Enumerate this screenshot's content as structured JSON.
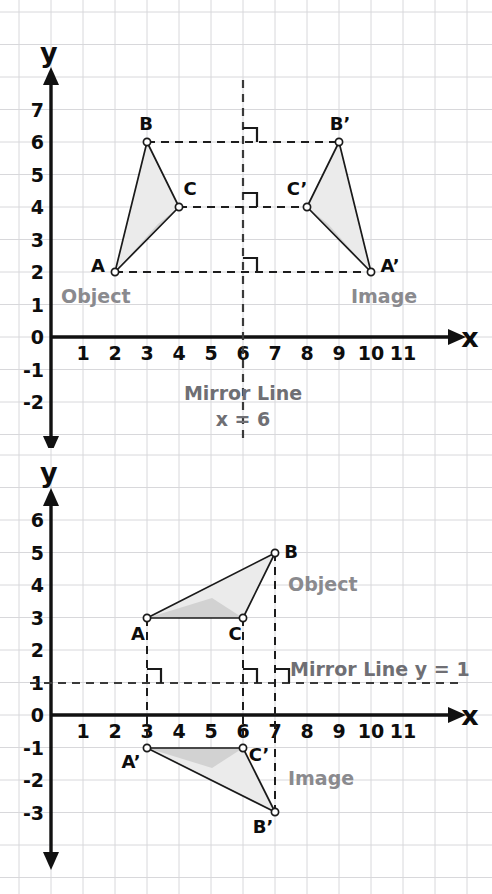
{
  "figure": {
    "title_hidden": "",
    "colors": {
      "grid": "#d8d8db",
      "axis": "#111111",
      "triangle_stroke": "#1a1a1a",
      "triangle_fill_light": "#ebebeb",
      "triangle_fill_mid": "#d2d2d2",
      "dashed": "#3a3a3a",
      "soft_text": "#8a8a8e",
      "mirror_text": "#6f6f74"
    }
  },
  "panels": [
    {
      "id": "reflection-in-vertical-mirror",
      "axis_x_label": "x",
      "axis_y_label": "y",
      "x_ticks": [
        "1",
        "2",
        "3",
        "4",
        "5",
        "6",
        "7",
        "8",
        "9",
        "10",
        "11"
      ],
      "y_ticks": [
        "7",
        "6",
        "5",
        "4",
        "3",
        "2",
        "1",
        "0",
        "-1",
        "-2"
      ],
      "object_label": "Object",
      "image_label": "Image",
      "mirror_label_line1": "Mirror Line",
      "mirror_label_line2": "x = 6",
      "vertex_labels": {
        "A": "A",
        "B": "B",
        "C": "C",
        "Ap": "A’",
        "Bp": "B’",
        "Cp": "C’"
      }
    },
    {
      "id": "reflection-in-horizontal-mirror",
      "axis_x_label": "x",
      "axis_y_label": "y",
      "x_ticks": [
        "1",
        "2",
        "3",
        "4",
        "5",
        "6",
        "7",
        "8",
        "9",
        "10",
        "11"
      ],
      "y_ticks": [
        "6",
        "5",
        "4",
        "3",
        "2",
        "1",
        "0",
        "-1",
        "-2",
        "-3"
      ],
      "object_label": "Object",
      "image_label": "Image",
      "mirror_label": "Mirror Line y = 1",
      "vertex_labels": {
        "A": "A",
        "B": "B",
        "C": "C",
        "Ap": "A’",
        "Bp": "B’",
        "Cp": "C’"
      }
    }
  ],
  "chart_data": [
    {
      "type": "scatter",
      "title": "Reflection of triangle ABC in the mirror line x = 6",
      "xlabel": "x",
      "ylabel": "y",
      "xlim": [
        0,
        12.8
      ],
      "ylim": [
        -2.6,
        7.6
      ],
      "grid": true,
      "legend": "none",
      "mirror_line": {
        "kind": "vertical",
        "equation": "x = 6",
        "x": 6
      },
      "series": [
        {
          "name": "Object",
          "points": [
            {
              "label": "A",
              "x": 2,
              "y": 2
            },
            {
              "label": "B",
              "x": 3,
              "y": 6
            },
            {
              "label": "C",
              "x": 4,
              "y": 4
            }
          ]
        },
        {
          "name": "Image",
          "points": [
            {
              "label": "A’",
              "x": 10,
              "y": 2
            },
            {
              "label": "B’",
              "x": 9,
              "y": 6
            },
            {
              "label": "C’",
              "x": 8,
              "y": 4
            }
          ]
        }
      ],
      "annotations": [
        {
          "text": "Object",
          "x": 2.1,
          "y": 1.1
        },
        {
          "text": "Image",
          "x": 9.1,
          "y": 1.1
        },
        {
          "text": "Mirror Line",
          "x": 6,
          "y": -1.85
        },
        {
          "text": "x = 6",
          "x": 6,
          "y": -2.4
        }
      ],
      "connector_lines": [
        {
          "from": [
            2,
            2
          ],
          "to": [
            10,
            2
          ]
        },
        {
          "from": [
            3,
            6
          ],
          "to": [
            9,
            6
          ]
        },
        {
          "from": [
            4,
            4
          ],
          "to": [
            8,
            4
          ]
        }
      ],
      "right_angle_marks": [
        {
          "x": 6,
          "y": 2
        },
        {
          "x": 6,
          "y": 4
        },
        {
          "x": 6,
          "y": 6
        }
      ]
    },
    {
      "type": "scatter",
      "title": "Reflection of triangle ABC in the mirror line y = 1",
      "xlabel": "x",
      "ylabel": "y",
      "xlim": [
        0,
        12.8
      ],
      "ylim": [
        -3.6,
        6.6
      ],
      "grid": true,
      "legend": "none",
      "mirror_line": {
        "kind": "horizontal",
        "equation": "y = 1",
        "y": 1
      },
      "series": [
        {
          "name": "Object",
          "points": [
            {
              "label": "A",
              "x": 3,
              "y": 3
            },
            {
              "label": "B",
              "x": 7,
              "y": 5
            },
            {
              "label": "C",
              "x": 6,
              "y": 3
            }
          ]
        },
        {
          "name": "Image",
          "points": [
            {
              "label": "A’",
              "x": 3,
              "y": -1
            },
            {
              "label": "B’",
              "x": 7,
              "y": -3
            },
            {
              "label": "C’",
              "x": 6,
              "y": -1
            }
          ]
        }
      ],
      "annotations": [
        {
          "text": "Object",
          "x": 7.4,
          "y": 4.1
        },
        {
          "text": "Image",
          "x": 7.4,
          "y": -2.0
        },
        {
          "text": "Mirror Line y = 1",
          "x": 7.35,
          "y": 1.5
        }
      ],
      "connector_lines": [
        {
          "from": [
            3,
            3
          ],
          "to": [
            3,
            -1
          ]
        },
        {
          "from": [
            7,
            5
          ],
          "to": [
            7,
            -3
          ]
        },
        {
          "from": [
            6,
            3
          ],
          "to": [
            6,
            -1
          ]
        }
      ],
      "right_angle_marks": [
        {
          "x": 3,
          "y": 1
        },
        {
          "x": 6,
          "y": 1
        },
        {
          "x": 7,
          "y": 1
        }
      ]
    }
  ]
}
